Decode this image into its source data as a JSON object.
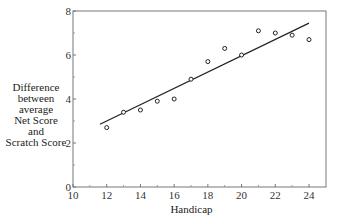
{
  "chart_data": {
    "type": "scatter",
    "title": "",
    "xlabel": "Handicap",
    "ylabel_lines": [
      "Difference",
      "between",
      "average",
      "Net Score",
      "and",
      "Scratch Score"
    ],
    "xlim": [
      10,
      25
    ],
    "ylim": [
      0,
      8
    ],
    "xticks": [
      10,
      12,
      14,
      16,
      18,
      20,
      22,
      24
    ],
    "yticks": [
      0,
      2,
      4,
      6,
      8
    ],
    "x_minor_ticks": [
      11,
      13,
      15,
      17,
      19,
      21,
      23
    ],
    "y_minor_ticks": [
      1,
      3,
      5,
      7
    ],
    "grid": false,
    "series": [
      {
        "name": "observed",
        "marker": "open-circle",
        "x": [
          12,
          13,
          14,
          15,
          16,
          17,
          18,
          19,
          20,
          21,
          22,
          23,
          24
        ],
        "y": [
          2.7,
          3.4,
          3.5,
          3.9,
          4.0,
          4.9,
          5.7,
          6.3,
          6.0,
          7.1,
          7.0,
          6.9,
          6.7
        ]
      }
    ],
    "fit_line": {
      "x": [
        11.6,
        24
      ],
      "y": [
        2.85,
        7.45
      ]
    }
  }
}
